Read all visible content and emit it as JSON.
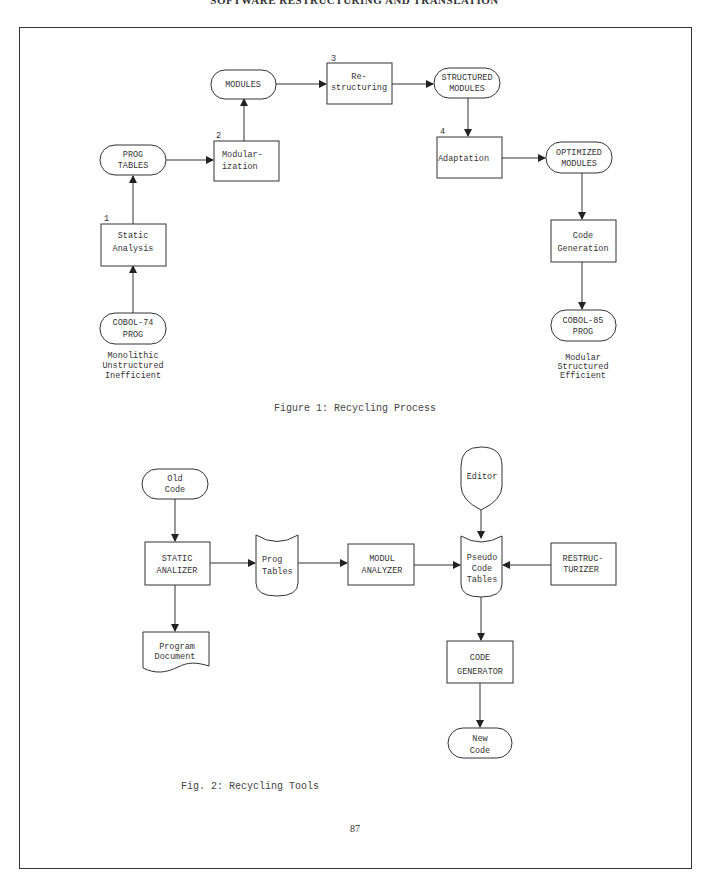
{
  "running_head": "SOFTWARE RESTRUCTURING AND TRANSLATION",
  "figure1": {
    "caption": "Figure 1: Recycling Process",
    "nodes": {
      "cobol74": {
        "lines": [
          "COBOL-74",
          "PROG"
        ],
        "shape": "terminal"
      },
      "static_analysis": {
        "number": "1",
        "lines": [
          "Static",
          "Analysis"
        ],
        "shape": "process"
      },
      "prog_tables": {
        "lines": [
          "PROG",
          "TABLES"
        ],
        "shape": "terminal"
      },
      "modularization": {
        "number": "2",
        "lines": [
          "Modular-",
          "ization"
        ],
        "shape": "process"
      },
      "modules": {
        "lines": [
          "MODULES"
        ],
        "shape": "terminal"
      },
      "restructuring": {
        "number": "3",
        "lines": [
          "Re-",
          "structuring"
        ],
        "shape": "process"
      },
      "structured_modules": {
        "lines": [
          "STRUCTURED",
          "MODULES"
        ],
        "shape": "terminal"
      },
      "adaptation": {
        "number": "4",
        "lines": [
          "Adaptation"
        ],
        "shape": "process"
      },
      "optimized_modules": {
        "lines": [
          "OPTIMIZED",
          "MODULES"
        ],
        "shape": "terminal"
      },
      "code_generation": {
        "lines": [
          "Code",
          "Generation"
        ],
        "shape": "process"
      },
      "cobol85": {
        "lines": [
          "COBOL-85",
          "PROG"
        ],
        "shape": "terminal"
      }
    },
    "left_note": [
      "Monolithic",
      "Unstructured",
      "Inefficient"
    ],
    "right_note": [
      "Modular",
      "Structured",
      "Efficient"
    ]
  },
  "figure2": {
    "caption": "Fig. 2: Recycling Tools",
    "nodes": {
      "old_code": {
        "lines": [
          "Old",
          "Code"
        ],
        "shape": "terminal"
      },
      "static_analizer": {
        "lines": [
          "STATIC",
          "ANALIZER"
        ],
        "shape": "process"
      },
      "program_document": {
        "lines": [
          "Program",
          "Document"
        ],
        "shape": "document"
      },
      "prog_tables": {
        "lines": [
          "Prog",
          "Tables"
        ],
        "shape": "storage"
      },
      "modul_analyzer": {
        "lines": [
          "MODUL",
          "ANALYZER"
        ],
        "shape": "process"
      },
      "editor": {
        "lines": [
          "Editor"
        ],
        "shape": "display"
      },
      "pseudo_code_tables": {
        "lines": [
          "Pseudo",
          "Code",
          "Tables"
        ],
        "shape": "storage"
      },
      "restructurizer": {
        "lines": [
          "RESTRUC-",
          "TURIZER"
        ],
        "shape": "process"
      },
      "code_generator": {
        "lines": [
          "CODE",
          "GENERATOR"
        ],
        "shape": "process"
      },
      "new_code": {
        "lines": [
          "New",
          "Code"
        ],
        "shape": "terminal"
      }
    }
  },
  "page_number": "87"
}
